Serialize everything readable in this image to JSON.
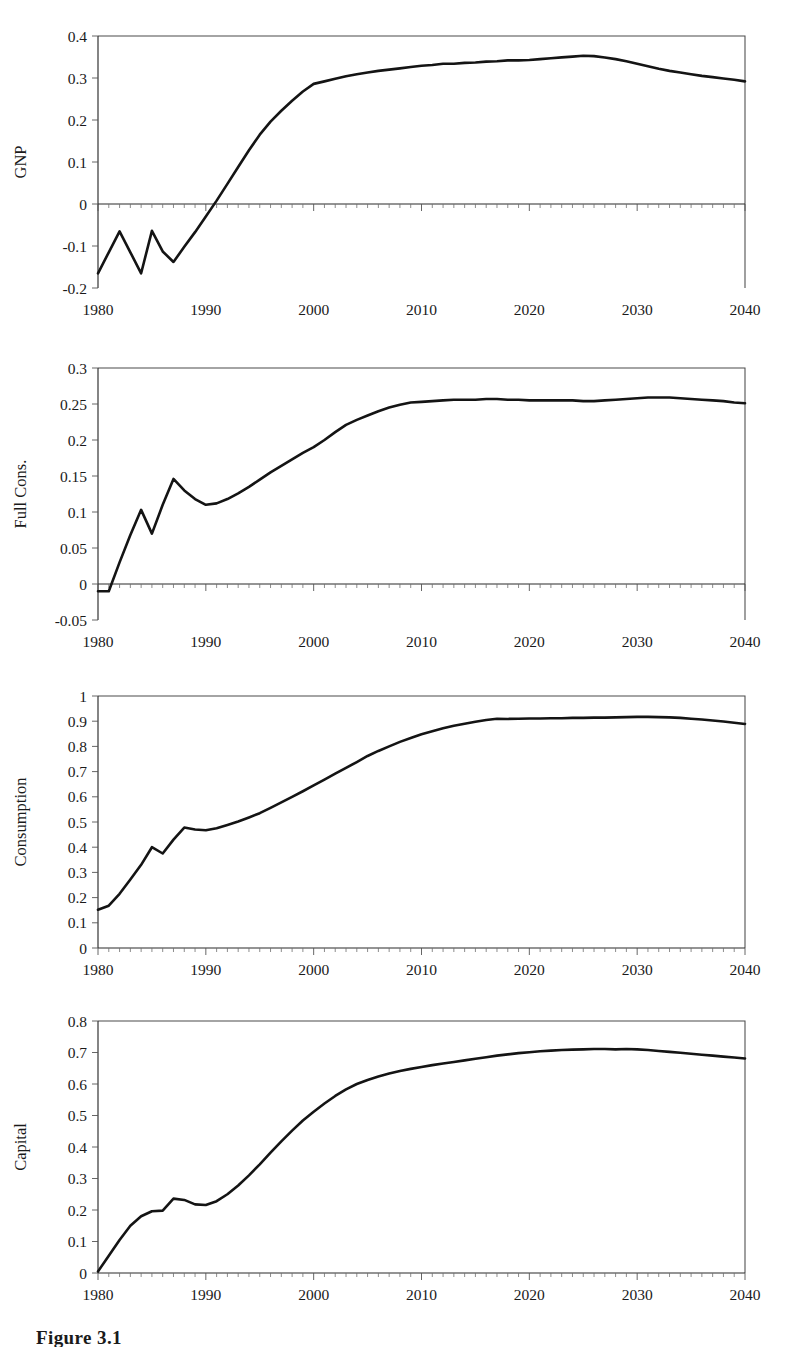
{
  "figure": {
    "caption": "Figure 3.1",
    "panel_count": 4
  },
  "axis": {
    "x_tick_labels": [
      "1980",
      "1990",
      "2000",
      "2010",
      "2020",
      "2030",
      "2040"
    ],
    "x_tick_values": [
      1980,
      1990,
      2000,
      2010,
      2020,
      2030,
      2040
    ],
    "x_min": 1980,
    "x_max": 2040
  },
  "panels": [
    {
      "ylabel": "GNP",
      "y_tick_labels": [
        "-0.2",
        "-0.1",
        "0",
        "0.1",
        "0.2",
        "0.3",
        "0.4"
      ],
      "y_tick_values": [
        -0.2,
        -0.1,
        0,
        0.1,
        0.2,
        0.3,
        0.4
      ]
    },
    {
      "ylabel": "Full Cons.",
      "y_tick_labels": [
        "-0.05",
        "0",
        "0.05",
        "0.1",
        "0.15",
        "0.2",
        "0.25",
        "0.3"
      ],
      "y_tick_values": [
        -0.05,
        0,
        0.05,
        0.1,
        0.15,
        0.2,
        0.25,
        0.3
      ]
    },
    {
      "ylabel": "Consumption",
      "y_tick_labels": [
        "0",
        "0.1",
        "0.2",
        "0.3",
        "0.4",
        "0.5",
        "0.6",
        "0.7",
        "0.8",
        "0.9",
        "1"
      ],
      "y_tick_values": [
        0,
        0.1,
        0.2,
        0.3,
        0.4,
        0.5,
        0.6,
        0.7,
        0.8,
        0.9,
        1
      ]
    },
    {
      "ylabel": "Capital",
      "y_tick_labels": [
        "0",
        "0.1",
        "0.2",
        "0.3",
        "0.4",
        "0.5",
        "0.6",
        "0.7",
        "0.8"
      ],
      "y_tick_values": [
        0,
        0.1,
        0.2,
        0.3,
        0.4,
        0.5,
        0.6,
        0.7,
        0.8
      ]
    }
  ],
  "chart_data": [
    {
      "type": "line",
      "title": "",
      "xlabel": "",
      "ylabel": "GNP",
      "xlim": [
        1980,
        2040
      ],
      "ylim": [
        -0.2,
        0.4
      ],
      "grid": false,
      "legend": "none",
      "x": [
        1980,
        1981,
        1982,
        1983,
        1984,
        1985,
        1986,
        1987,
        1988,
        1989,
        1990,
        1991,
        1992,
        1993,
        1994,
        1995,
        1996,
        1997,
        1998,
        1999,
        2000,
        2001,
        2002,
        2003,
        2004,
        2005,
        2006,
        2007,
        2008,
        2009,
        2010,
        2011,
        2012,
        2013,
        2014,
        2015,
        2016,
        2017,
        2018,
        2019,
        2020,
        2021,
        2022,
        2023,
        2024,
        2025,
        2026,
        2027,
        2028,
        2029,
        2030,
        2031,
        2032,
        2033,
        2034,
        2035,
        2036,
        2037,
        2038,
        2039,
        2040
      ],
      "values": [
        -0.165,
        -0.115,
        -0.065,
        -0.115,
        -0.165,
        -0.064,
        -0.113,
        -0.138,
        -0.102,
        -0.067,
        -0.03,
        0.008,
        0.048,
        0.088,
        0.128,
        0.165,
        0.196,
        0.222,
        0.246,
        0.268,
        0.286,
        0.292,
        0.298,
        0.304,
        0.309,
        0.313,
        0.317,
        0.32,
        0.323,
        0.326,
        0.329,
        0.331,
        0.334,
        0.334,
        0.336,
        0.337,
        0.339,
        0.34,
        0.342,
        0.342,
        0.343,
        0.345,
        0.347,
        0.349,
        0.351,
        0.353,
        0.352,
        0.349,
        0.345,
        0.34,
        0.334,
        0.328,
        0.322,
        0.317,
        0.313,
        0.309,
        0.305,
        0.302,
        0.299,
        0.296,
        0.292
      ]
    },
    {
      "type": "line",
      "title": "",
      "xlabel": "",
      "ylabel": "Full Cons.",
      "xlim": [
        1980,
        2040
      ],
      "ylim": [
        -0.05,
        0.3
      ],
      "grid": false,
      "legend": "none",
      "x": [
        1980,
        1981,
        1982,
        1983,
        1984,
        1985,
        1986,
        1987,
        1988,
        1989,
        1990,
        1991,
        1992,
        1993,
        1994,
        1995,
        1996,
        1997,
        1998,
        1999,
        2000,
        2001,
        2002,
        2003,
        2004,
        2005,
        2006,
        2007,
        2008,
        2009,
        2010,
        2011,
        2012,
        2013,
        2014,
        2015,
        2016,
        2017,
        2018,
        2019,
        2020,
        2021,
        2022,
        2023,
        2024,
        2025,
        2026,
        2027,
        2028,
        2029,
        2030,
        2031,
        2032,
        2033,
        2034,
        2035,
        2036,
        2037,
        2038,
        2039,
        2040
      ],
      "values": [
        -0.01,
        -0.01,
        0.03,
        0.068,
        0.103,
        0.07,
        0.11,
        0.146,
        0.13,
        0.118,
        0.11,
        0.112,
        0.118,
        0.126,
        0.135,
        0.145,
        0.155,
        0.164,
        0.173,
        0.182,
        0.19,
        0.2,
        0.211,
        0.221,
        0.228,
        0.234,
        0.24,
        0.245,
        0.249,
        0.252,
        0.253,
        0.254,
        0.255,
        0.256,
        0.256,
        0.256,
        0.257,
        0.257,
        0.256,
        0.256,
        0.255,
        0.255,
        0.255,
        0.255,
        0.255,
        0.254,
        0.254,
        0.255,
        0.256,
        0.257,
        0.258,
        0.259,
        0.259,
        0.259,
        0.258,
        0.257,
        0.256,
        0.255,
        0.254,
        0.252,
        0.251
      ]
    },
    {
      "type": "line",
      "title": "",
      "xlabel": "",
      "ylabel": "Consumption",
      "xlim": [
        1980,
        2040
      ],
      "ylim": [
        0,
        1
      ],
      "grid": false,
      "legend": "none",
      "x": [
        1980,
        1981,
        1982,
        1983,
        1984,
        1985,
        1986,
        1987,
        1988,
        1989,
        1990,
        1991,
        1992,
        1993,
        1994,
        1995,
        1996,
        1997,
        1998,
        1999,
        2000,
        2001,
        2002,
        2003,
        2004,
        2005,
        2006,
        2007,
        2008,
        2009,
        2010,
        2011,
        2012,
        2013,
        2014,
        2015,
        2016,
        2017,
        2018,
        2019,
        2020,
        2021,
        2022,
        2023,
        2024,
        2025,
        2026,
        2027,
        2028,
        2029,
        2030,
        2031,
        2032,
        2033,
        2034,
        2035,
        2036,
        2037,
        2038,
        2039,
        2040
      ],
      "values": [
        0.152,
        0.168,
        0.215,
        0.272,
        0.33,
        0.4,
        0.375,
        0.43,
        0.478,
        0.47,
        0.467,
        0.475,
        0.488,
        0.502,
        0.518,
        0.535,
        0.556,
        0.578,
        0.6,
        0.622,
        0.645,
        0.668,
        0.692,
        0.715,
        0.738,
        0.762,
        0.782,
        0.8,
        0.818,
        0.833,
        0.848,
        0.86,
        0.872,
        0.882,
        0.89,
        0.898,
        0.905,
        0.91,
        0.909,
        0.91,
        0.911,
        0.911,
        0.912,
        0.912,
        0.913,
        0.913,
        0.914,
        0.914,
        0.915,
        0.916,
        0.917,
        0.917,
        0.916,
        0.915,
        0.913,
        0.91,
        0.907,
        0.903,
        0.899,
        0.894,
        0.889
      ]
    },
    {
      "type": "line",
      "title": "",
      "xlabel": "",
      "ylabel": "Capital",
      "xlim": [
        1980,
        2040
      ],
      "ylim": [
        0,
        0.8
      ],
      "grid": false,
      "legend": "none",
      "x": [
        1980,
        1981,
        1982,
        1983,
        1984,
        1985,
        1986,
        1987,
        1988,
        1989,
        1990,
        1991,
        1992,
        1993,
        1994,
        1995,
        1996,
        1997,
        1998,
        1999,
        2000,
        2001,
        2002,
        2003,
        2004,
        2005,
        2006,
        2007,
        2008,
        2009,
        2010,
        2011,
        2012,
        2013,
        2014,
        2015,
        2016,
        2017,
        2018,
        2019,
        2020,
        2021,
        2022,
        2023,
        2024,
        2025,
        2026,
        2027,
        2028,
        2029,
        2030,
        2031,
        2032,
        2033,
        2034,
        2035,
        2036,
        2037,
        2038,
        2039,
        2040
      ],
      "values": [
        0.005,
        0.055,
        0.105,
        0.15,
        0.18,
        0.196,
        0.198,
        0.236,
        0.232,
        0.218,
        0.216,
        0.228,
        0.25,
        0.278,
        0.31,
        0.345,
        0.382,
        0.418,
        0.452,
        0.484,
        0.512,
        0.538,
        0.562,
        0.583,
        0.6,
        0.613,
        0.624,
        0.633,
        0.641,
        0.648,
        0.654,
        0.66,
        0.665,
        0.67,
        0.675,
        0.68,
        0.685,
        0.69,
        0.694,
        0.698,
        0.701,
        0.704,
        0.706,
        0.708,
        0.709,
        0.71,
        0.711,
        0.711,
        0.71,
        0.711,
        0.71,
        0.708,
        0.705,
        0.702,
        0.699,
        0.696,
        0.693,
        0.69,
        0.687,
        0.684,
        0.681
      ]
    }
  ]
}
